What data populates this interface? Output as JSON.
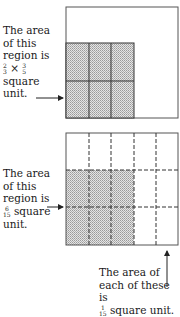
{
  "top_figure": {
    "caption_lines": [
      "The area",
      "of this",
      "region is"
    ],
    "expression": {
      "a_num": "2",
      "a_den": "3",
      "op": "×",
      "b_num": "3",
      "b_den": "5"
    },
    "caption_tail": [
      "square",
      "unit."
    ],
    "columns": 3,
    "rows": 2,
    "total_columns": 5,
    "total_rows": 3
  },
  "bottom_figure": {
    "caption_lines": [
      "The area",
      "of this",
      "region is"
    ],
    "fraction": {
      "num": "6",
      "den": "15"
    },
    "fraction_suffix": "square",
    "caption_tail": "unit.",
    "grid_columns": 5,
    "grid_rows": 3
  },
  "note": {
    "lines": [
      "The area of",
      "each of these is"
    ],
    "fraction": {
      "num": "1",
      "den": "15"
    },
    "suffix": "square unit."
  },
  "colors": {
    "shade": "#c8c8c8",
    "line": "#444444"
  }
}
